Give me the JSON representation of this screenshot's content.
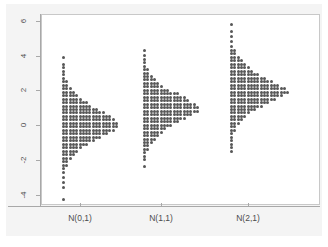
{
  "figure": {
    "background_color": "#ffffff",
    "panel_color": "#ffffff",
    "surround_color": "#f4f4f4",
    "axis_color": "#a8a8a8",
    "dot_color": "#575757"
  },
  "chart_data": {
    "type": "scatter",
    "plot_style": "dot-density histogram (stacked dots per bin)",
    "title": "",
    "subtitle": "",
    "xlabel": "",
    "ylabel": "",
    "grid": false,
    "legend": "none",
    "ylim": [
      -4.6,
      6.4
    ],
    "yticks": [
      6,
      4,
      2,
      0,
      -2,
      -4
    ],
    "ytick_labels": [
      "6",
      "4",
      "2",
      "0",
      "-2",
      "-4"
    ],
    "ytick_rotation": -90,
    "categories": [
      "N(0,1)",
      "N(1,1)",
      "N(2,1)"
    ],
    "xtick_labels": [
      "N(0,1)",
      "N(1,1)",
      "N(2,1)"
    ],
    "series": [
      {
        "name": "N(0,1)",
        "mean": 0,
        "sd": 1,
        "n": 200,
        "bin_width": 0.2,
        "bins": [
          {
            "value": 3.9,
            "count": 1
          },
          {
            "value": 3.5,
            "count": 1
          },
          {
            "value": 3.3,
            "count": 1
          },
          {
            "value": 3.1,
            "count": 1
          },
          {
            "value": 2.9,
            "count": 1
          },
          {
            "value": 2.7,
            "count": 1
          },
          {
            "value": 2.5,
            "count": 2
          },
          {
            "value": 2.3,
            "count": 2
          },
          {
            "value": 2.1,
            "count": 3
          },
          {
            "value": 1.9,
            "count": 4
          },
          {
            "value": 1.7,
            "count": 5
          },
          {
            "value": 1.5,
            "count": 6
          },
          {
            "value": 1.3,
            "count": 8
          },
          {
            "value": 1.1,
            "count": 9
          },
          {
            "value": 0.9,
            "count": 11
          },
          {
            "value": 0.7,
            "count": 13
          },
          {
            "value": 0.5,
            "count": 15
          },
          {
            "value": 0.3,
            "count": 16
          },
          {
            "value": 0.1,
            "count": 17
          },
          {
            "value": -0.1,
            "count": 17
          },
          {
            "value": -0.3,
            "count": 16
          },
          {
            "value": -0.5,
            "count": 14
          },
          {
            "value": -0.7,
            "count": 12
          },
          {
            "value": -0.9,
            "count": 10
          },
          {
            "value": -1.1,
            "count": 8
          },
          {
            "value": -1.3,
            "count": 6
          },
          {
            "value": -1.5,
            "count": 5
          },
          {
            "value": -1.7,
            "count": 4
          },
          {
            "value": -1.9,
            "count": 3
          },
          {
            "value": -2.1,
            "count": 2
          },
          {
            "value": -2.3,
            "count": 2
          },
          {
            "value": -2.5,
            "count": 1
          },
          {
            "value": -2.7,
            "count": 1
          },
          {
            "value": -3.0,
            "count": 1
          },
          {
            "value": -3.3,
            "count": 1
          },
          {
            "value": -3.6,
            "count": 1
          },
          {
            "value": -4.3,
            "count": 1
          }
        ]
      },
      {
        "name": "N(1,1)",
        "mean": 1,
        "sd": 1,
        "n": 200,
        "bin_width": 0.2,
        "bins": [
          {
            "value": 4.3,
            "count": 1
          },
          {
            "value": 4.0,
            "count": 1
          },
          {
            "value": 3.8,
            "count": 1
          },
          {
            "value": 3.6,
            "count": 1
          },
          {
            "value": 3.4,
            "count": 1
          },
          {
            "value": 3.2,
            "count": 2
          },
          {
            "value": 3.0,
            "count": 2
          },
          {
            "value": 2.8,
            "count": 3
          },
          {
            "value": 2.6,
            "count": 4
          },
          {
            "value": 2.4,
            "count": 5
          },
          {
            "value": 2.2,
            "count": 6
          },
          {
            "value": 2.0,
            "count": 8
          },
          {
            "value": 1.8,
            "count": 11
          },
          {
            "value": 1.6,
            "count": 13
          },
          {
            "value": 1.4,
            "count": 14
          },
          {
            "value": 1.2,
            "count": 16
          },
          {
            "value": 1.0,
            "count": 17
          },
          {
            "value": 0.8,
            "count": 17
          },
          {
            "value": 0.6,
            "count": 15
          },
          {
            "value": 0.4,
            "count": 13
          },
          {
            "value": 0.2,
            "count": 11
          },
          {
            "value": 0.0,
            "count": 9
          },
          {
            "value": -0.2,
            "count": 7
          },
          {
            "value": -0.4,
            "count": 6
          },
          {
            "value": -0.6,
            "count": 5
          },
          {
            "value": -0.8,
            "count": 4
          },
          {
            "value": -1.0,
            "count": 3
          },
          {
            "value": -1.2,
            "count": 2
          },
          {
            "value": -1.4,
            "count": 2
          },
          {
            "value": -1.6,
            "count": 1
          },
          {
            "value": -1.8,
            "count": 1
          },
          {
            "value": -2.0,
            "count": 1
          },
          {
            "value": -2.4,
            "count": 1
          }
        ]
      },
      {
        "name": "N(2,1)",
        "mean": 2,
        "sd": 1,
        "n": 200,
        "bin_width": 0.2,
        "bins": [
          {
            "value": 5.8,
            "count": 1
          },
          {
            "value": 5.4,
            "count": 1
          },
          {
            "value": 5.1,
            "count": 1
          },
          {
            "value": 4.8,
            "count": 1
          },
          {
            "value": 4.5,
            "count": 1
          },
          {
            "value": 4.3,
            "count": 2
          },
          {
            "value": 4.1,
            "count": 2
          },
          {
            "value": 3.9,
            "count": 3
          },
          {
            "value": 3.7,
            "count": 4
          },
          {
            "value": 3.5,
            "count": 5
          },
          {
            "value": 3.3,
            "count": 6
          },
          {
            "value": 3.1,
            "count": 7
          },
          {
            "value": 2.9,
            "count": 9
          },
          {
            "value": 2.7,
            "count": 11
          },
          {
            "value": 2.5,
            "count": 13
          },
          {
            "value": 2.3,
            "count": 15
          },
          {
            "value": 2.1,
            "count": 17
          },
          {
            "value": 1.9,
            "count": 18
          },
          {
            "value": 1.7,
            "count": 16
          },
          {
            "value": 1.5,
            "count": 14
          },
          {
            "value": 1.3,
            "count": 12
          },
          {
            "value": 1.1,
            "count": 10
          },
          {
            "value": 0.9,
            "count": 8
          },
          {
            "value": 0.7,
            "count": 6
          },
          {
            "value": 0.5,
            "count": 5
          },
          {
            "value": 0.3,
            "count": 4
          },
          {
            "value": 0.1,
            "count": 3
          },
          {
            "value": -0.1,
            "count": 2
          },
          {
            "value": -0.3,
            "count": 2
          },
          {
            "value": -0.5,
            "count": 1
          },
          {
            "value": -0.7,
            "count": 1
          },
          {
            "value": -0.9,
            "count": 1
          },
          {
            "value": -1.1,
            "count": 1
          },
          {
            "value": -1.3,
            "count": 1
          },
          {
            "value": -1.5,
            "count": 1
          }
        ]
      }
    ]
  }
}
